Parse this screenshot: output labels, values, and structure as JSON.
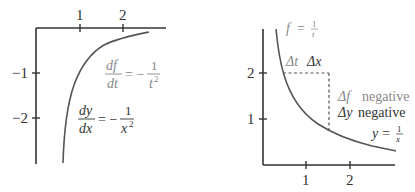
{
  "left_panel": {
    "x_ticks": [
      "1",
      "2"
    ],
    "y_ticks": [
      "−1",
      "−2"
    ],
    "label_gray": {
      "num": "df",
      "den": "dt",
      "rhs_num": "1",
      "rhs_den": "t",
      "exp": "2",
      "eq": "= −"
    },
    "label_dark": {
      "num": "dy",
      "den": "dx",
      "rhs_num": "1",
      "rhs_den": "x",
      "exp": "2",
      "eq": "= −"
    },
    "curve": "y' = -1/x^2"
  },
  "right_panel": {
    "x_ticks": [
      "1",
      "2"
    ],
    "y_ticks": [
      "2",
      "1"
    ],
    "label_f": {
      "lhs": "f",
      "eq": "=",
      "num": "1",
      "den": "t"
    },
    "label_y": {
      "lhs": "y",
      "eq": "=",
      "num": "1",
      "den": "x"
    },
    "delta_labels": {
      "dt": "Δt",
      "dx": "Δx"
    },
    "delta_f": {
      "sym": "Δf",
      "text": "negative"
    },
    "delta_y": {
      "sym": "Δy",
      "text": "negative"
    },
    "curve": "y = 1/x"
  },
  "colors": {
    "axis": "#333333",
    "curve": "#555555",
    "label_gray": "#888888",
    "label_dark": "#333333"
  }
}
